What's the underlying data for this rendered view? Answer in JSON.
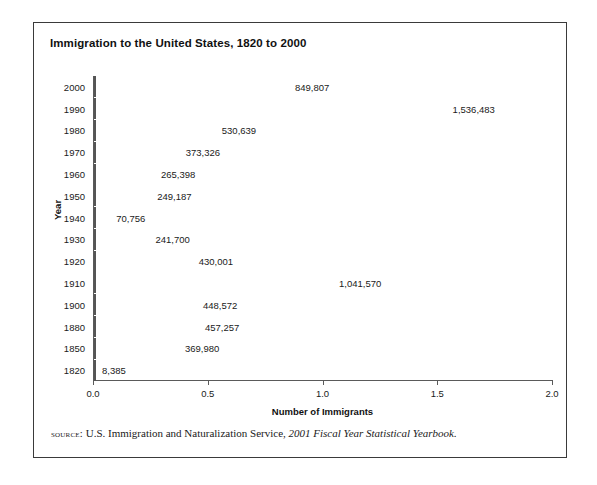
{
  "figure": {
    "title": "Immigration to the United States, 1820 to 2000",
    "source_label": "source:",
    "source_text": "U.S. Immigration and Naturalization Service,",
    "source_publication": "2001 Fiscal Year Statistical Yearbook.",
    "bar_color": "#a9a9a9",
    "bar_border_color": "#555555",
    "frame_color": "#3a3a3a"
  },
  "chart_data": {
    "type": "bar",
    "orientation": "horizontal",
    "title": "Immigration to the United States, 1820 to 2000",
    "xlabel": "Number of Immigrants",
    "ylabel": "Year",
    "xlim": [
      0,
      2000000
    ],
    "x_tick_values": [
      0,
      500000,
      1000000,
      1500000,
      2000000
    ],
    "x_tick_labels": [
      "0.0",
      "0.5",
      "1.0",
      "1.5",
      "2.0"
    ],
    "x_units": "millions",
    "grid": false,
    "legend": false,
    "categories": [
      "2000",
      "1990",
      "1980",
      "1970",
      "1960",
      "1950",
      "1940",
      "1930",
      "1920",
      "1910",
      "1900",
      "1880",
      "1850",
      "1820"
    ],
    "values": [
      849807,
      1536483,
      530639,
      373326,
      265398,
      249187,
      70756,
      241700,
      430001,
      1041570,
      448572,
      457257,
      369980,
      8385
    ],
    "value_labels": [
      "849,807",
      "1,536,483",
      "530,639",
      "373,326",
      "265,398",
      "249,187",
      "70,756",
      "241,700",
      "430,001",
      "1,041,570",
      "448,572",
      "457,257",
      "369,980",
      "8,385"
    ]
  }
}
